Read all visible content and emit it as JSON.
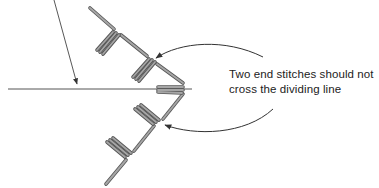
{
  "diagram": {
    "type": "stitch-illustration",
    "annotation": {
      "line1": "Two end stitches should not",
      "line2": "cross the dividing line"
    },
    "colors": {
      "stitch_fill": "#9a9a9a",
      "stitch_outline": "#555555",
      "line": "#444444",
      "text": "#222222"
    }
  }
}
